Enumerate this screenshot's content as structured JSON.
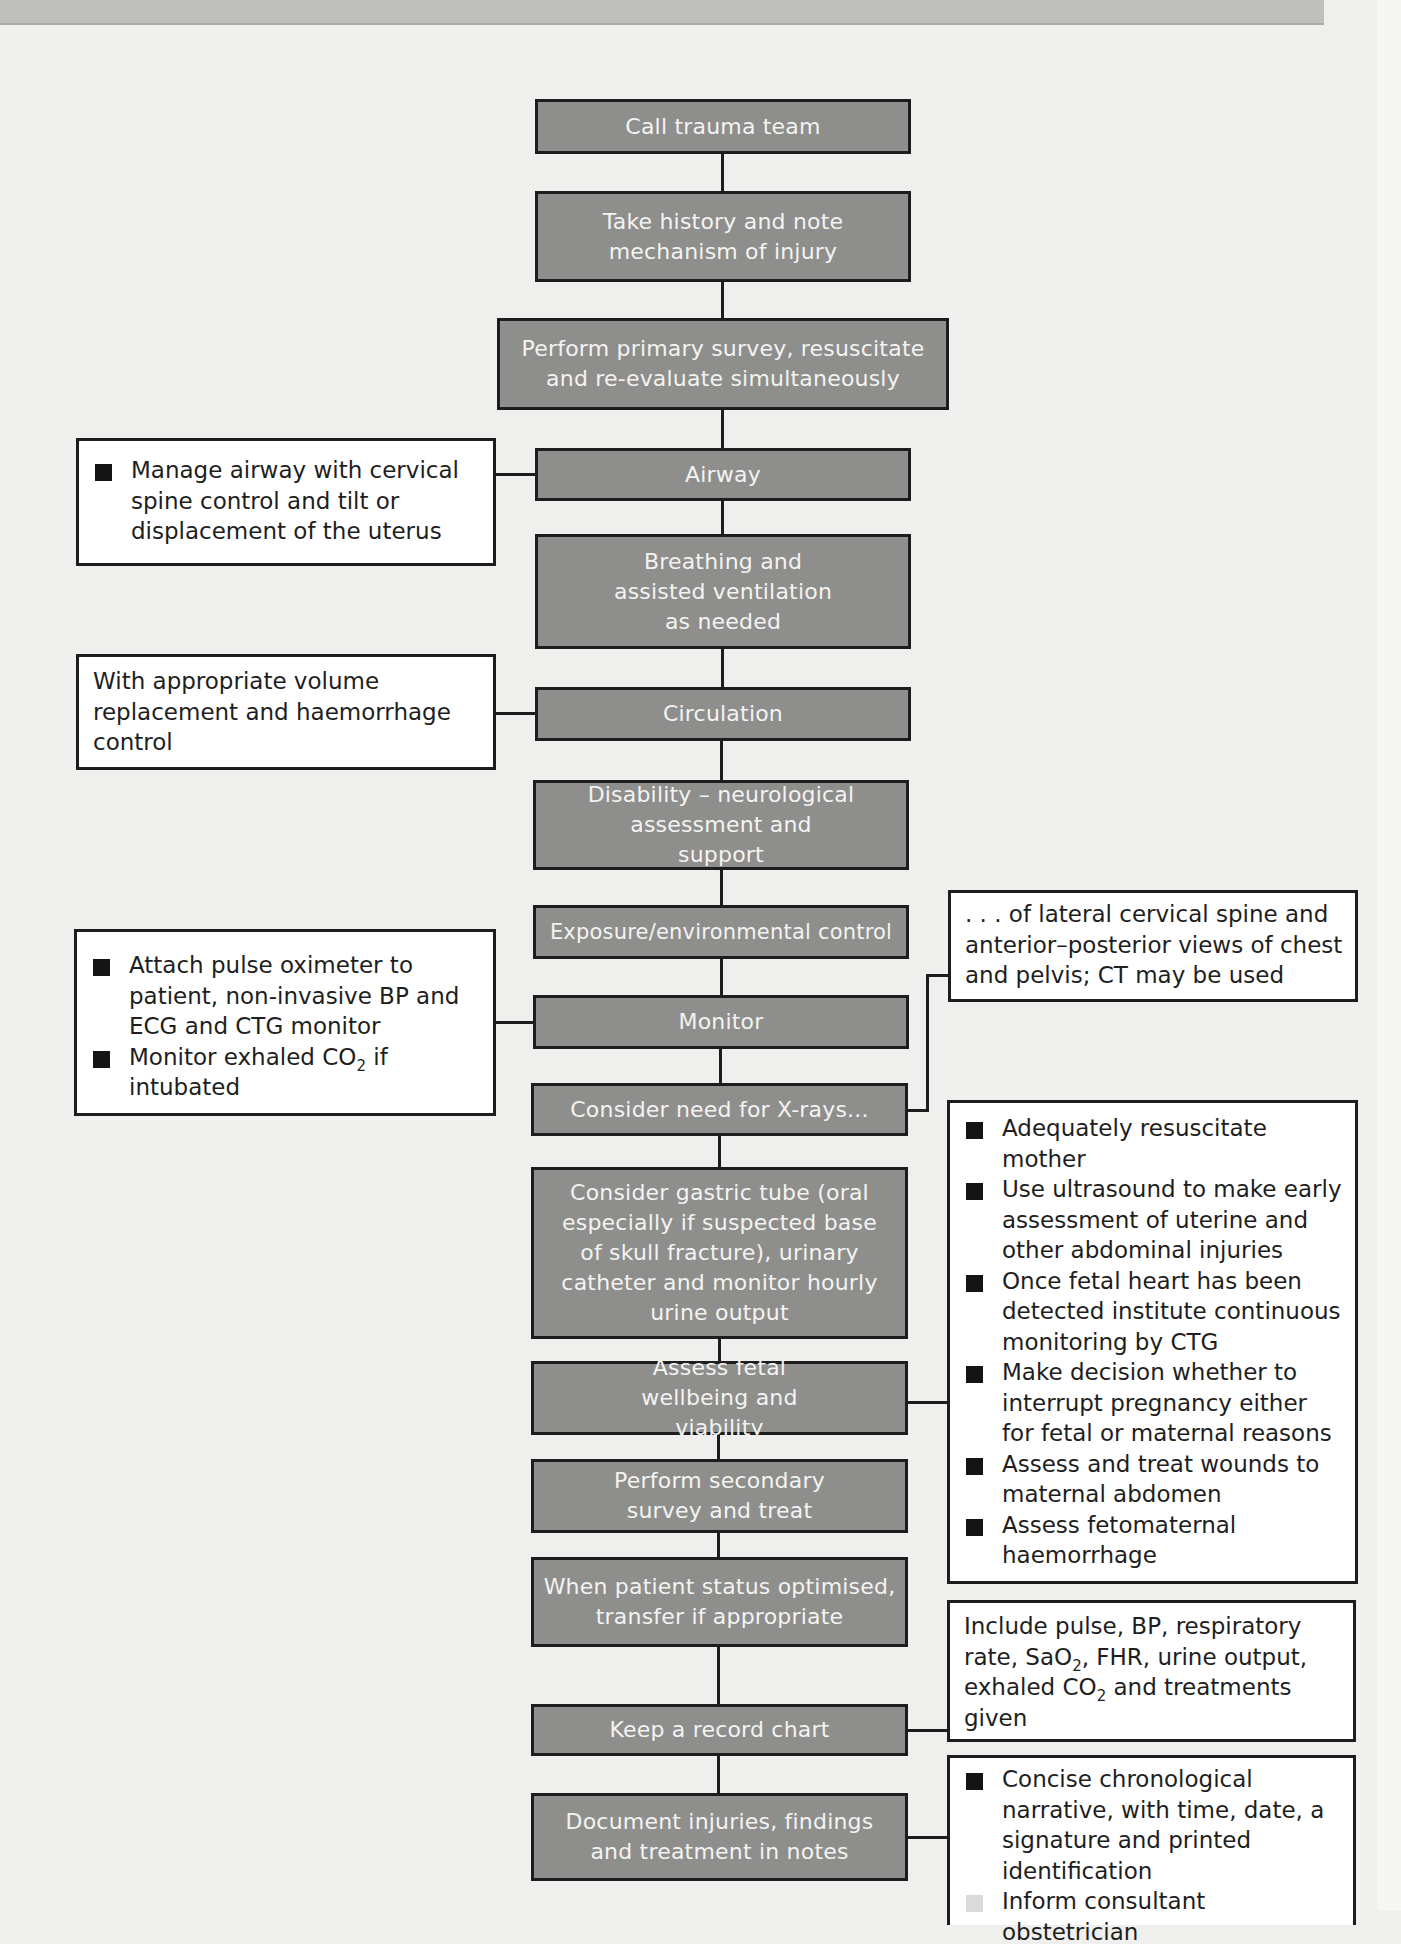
{
  "flowchart": {
    "steps": [
      {
        "id": "call-trauma-team",
        "label": "Call trauma team"
      },
      {
        "id": "take-history",
        "label": "Take history and note mechanism of injury"
      },
      {
        "id": "primary-survey",
        "label": "Perform primary survey, resuscitate and re-evaluate simultaneously"
      },
      {
        "id": "airway",
        "label": "Airway"
      },
      {
        "id": "breathing",
        "label": "Breathing and assisted ventilation as needed"
      },
      {
        "id": "circulation",
        "label": "Circulation"
      },
      {
        "id": "disability",
        "label": "Disability – neurological assessment and support"
      },
      {
        "id": "exposure",
        "label": "Exposure/environmental control"
      },
      {
        "id": "monitor",
        "label": "Monitor"
      },
      {
        "id": "xrays",
        "label": "Consider need for X-rays..."
      },
      {
        "id": "gastric-tube",
        "label": "Consider gastric tube (oral especially if suspected base of skull fracture), urinary catheter and monitor hourly urine output"
      },
      {
        "id": "fetal-wellbeing",
        "label": "Assess fetal wellbeing and viability"
      },
      {
        "id": "secondary-survey",
        "label": "Perform secondary survey and treat"
      },
      {
        "id": "transfer",
        "label": "When patient status optimised, transfer if appropriate"
      },
      {
        "id": "record-chart",
        "label": "Keep a record chart"
      },
      {
        "id": "document-injuries",
        "label": "Document injuries, findings and treatment in notes"
      }
    ],
    "notes": {
      "airway": {
        "bullets": [
          "Manage airway with cervical spine control and tilt or displacement of the uterus"
        ]
      },
      "circulation": {
        "text": "With appropriate volume replacement and haemorrhage control"
      },
      "monitor": {
        "bullets": [
          "Attach pulse oximeter to patient, non-invasive BP and ECG and CTG monitor",
          {
            "pre": "Monitor exhaled CO",
            "sub": "2",
            "post": " if intubated"
          }
        ],
        "bullet_1_pre": "Monitor exhaled CO",
        "bullet_1_sub": "2",
        "bullet_1_post": " if intubated"
      },
      "xrays": {
        "text": ". . . of lateral cervical spine and anterior–posterior views of chest and pelvis; CT may be used"
      },
      "fetal-wellbeing": {
        "bullets": [
          "Adequately resuscitate mother",
          "Use ultrasound to make early assessment of uterine and other abdominal injuries",
          "Once fetal heart has been detected institute continuous monitoring by CTG",
          "Make decision whether to interrupt pregnancy either for fetal or maternal reasons",
          "Assess and treat wounds to maternal abdomen",
          "Assess fetomaternal haemorrhage"
        ]
      },
      "record-chart": {
        "part1": "Include pulse, BP, respiratory rate, SaO",
        "sub1": "2",
        "part2": ", FHR, urine output, exhaled CO",
        "sub2": "2",
        "part3": " and treatments given"
      },
      "document-injuries": {
        "bullets": [
          "Concise chronological narrative, with time, date, a signature and printed identification",
          "Inform consultant obstetrician"
        ]
      }
    }
  },
  "colors": {
    "background": "#efefed",
    "step_fill": "#8e8e8c",
    "step_text": "#f3f3f1",
    "border": "#1d1d1d",
    "note_fill": "#ffffff",
    "top_band": "#bfbfbd"
  }
}
